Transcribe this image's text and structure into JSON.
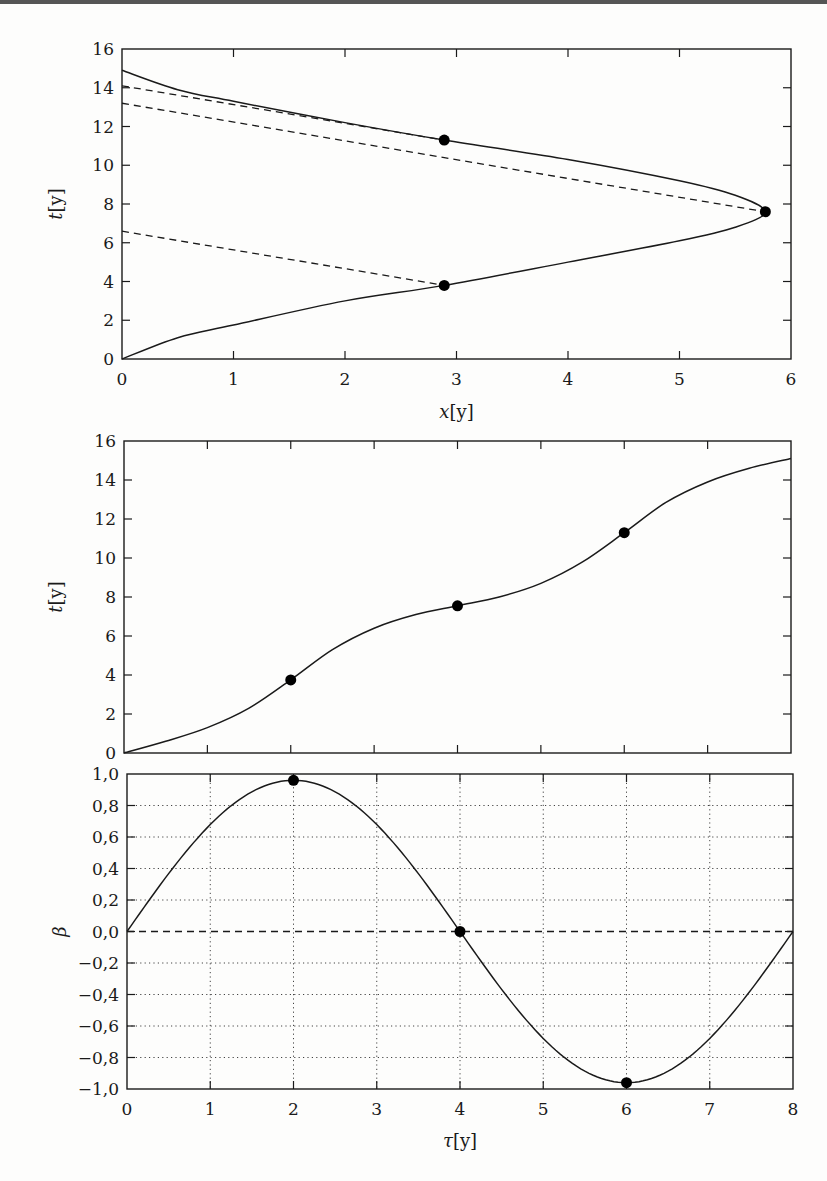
{
  "chart_data": [
    {
      "type": "line",
      "title": "",
      "xlabel": "x[y]",
      "ylabel": "t[y]",
      "xlim": [
        0,
        6
      ],
      "ylim": [
        0,
        16
      ],
      "xticks": [
        "0",
        "1",
        "2",
        "3",
        "4",
        "5",
        "6"
      ],
      "yticks": [
        "0",
        "2",
        "4",
        "6",
        "8",
        "10",
        "12",
        "14",
        "16"
      ],
      "grid": false,
      "series": [
        {
          "name": "worldline",
          "style": "solid",
          "points": [
            [
              0,
              0
            ],
            [
              0.5,
              1.1
            ],
            [
              1,
              1.75
            ],
            [
              2,
              3.0
            ],
            [
              2.89,
              3.8
            ],
            [
              4,
              5.0
            ],
            [
              5,
              6.1
            ],
            [
              5.5,
              6.8
            ],
            [
              5.77,
              7.6
            ],
            [
              5.5,
              8.45
            ],
            [
              5,
              9.2
            ],
            [
              4,
              10.3
            ],
            [
              2.89,
              11.3
            ],
            [
              2,
              12.2
            ],
            [
              1,
              13.3
            ],
            [
              0.5,
              13.9
            ],
            [
              0,
              14.9
            ]
          ]
        },
        {
          "name": "simultaneity-1",
          "style": "dashed",
          "points": [
            [
              0,
              6.6
            ],
            [
              2.89,
              3.8
            ]
          ]
        },
        {
          "name": "simultaneity-2",
          "style": "dashed",
          "points": [
            [
              0,
              13.2
            ],
            [
              5.77,
              7.6
            ]
          ]
        },
        {
          "name": "simultaneity-3",
          "style": "dashed",
          "points": [
            [
              0,
              14.1
            ],
            [
              2.89,
              11.3
            ]
          ]
        }
      ],
      "markers": [
        [
          2.89,
          3.8
        ],
        [
          5.77,
          7.6
        ],
        [
          2.89,
          11.3
        ]
      ]
    },
    {
      "type": "line",
      "title": "",
      "xlabel": "",
      "ylabel": "t[y]",
      "xlim": [
        0,
        8
      ],
      "ylim": [
        0,
        16
      ],
      "yticks": [
        "0",
        "2",
        "4",
        "6",
        "8",
        "10",
        "12",
        "14",
        "16"
      ],
      "grid": false,
      "series": [
        {
          "name": "t(tau)",
          "style": "solid",
          "points": [
            [
              0,
              0
            ],
            [
              0.5,
              0.6
            ],
            [
              1,
              1.3
            ],
            [
              1.5,
              2.3
            ],
            [
              2,
              3.75
            ],
            [
              2.5,
              5.3
            ],
            [
              3,
              6.4
            ],
            [
              3.5,
              7.1
            ],
            [
              4,
              7.55
            ],
            [
              4.5,
              8.0
            ],
            [
              5,
              8.7
            ],
            [
              5.5,
              9.8
            ],
            [
              6,
              11.3
            ],
            [
              6.5,
              12.85
            ],
            [
              7,
              13.9
            ],
            [
              7.5,
              14.6
            ],
            [
              8,
              15.1
            ]
          ]
        }
      ],
      "markers": [
        [
          2,
          3.75
        ],
        [
          4,
          7.55
        ],
        [
          6,
          11.3
        ]
      ]
    },
    {
      "type": "line",
      "title": "",
      "xlabel": "τ[y]",
      "ylabel": "β",
      "xlim": [
        0,
        8
      ],
      "ylim": [
        -1.0,
        1.0
      ],
      "xticks": [
        "0",
        "1",
        "2",
        "3",
        "4",
        "5",
        "6",
        "7",
        "8"
      ],
      "yticks": [
        "−1,0",
        "−0,8",
        "−0,6",
        "−0,4",
        "−0,2",
        "0,0",
        "0,2",
        "0,4",
        "0,6",
        "0,8",
        "1,0"
      ],
      "grid": true,
      "series": [
        {
          "name": "beta(tau)",
          "style": "solid",
          "function": "0.96*sin(pi*tau/4)"
        },
        {
          "name": "zero-line",
          "style": "dashed",
          "points": [
            [
              0,
              0
            ],
            [
              8,
              0
            ]
          ]
        }
      ],
      "markers": [
        [
          2,
          0.96
        ],
        [
          4,
          0.0
        ],
        [
          6,
          -0.96
        ]
      ]
    }
  ],
  "labels": {
    "top_xlabel_var": "x",
    "top_ylabel_var": "t",
    "mid_ylabel_var": "t",
    "bot_xlabel_var": "τ",
    "bot_ylabel_var": "β",
    "unit": "[y]"
  }
}
